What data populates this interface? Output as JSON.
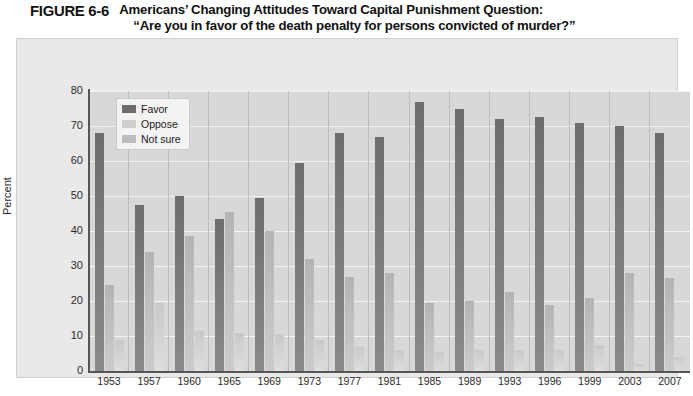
{
  "figure": {
    "label": "FIGURE 6-6",
    "title_line1": "Americans’ Changing Attitudes Toward Capital Punishment Question:",
    "title_line2": "“Are you in favor of the death penalty for persons convicted of murder?”"
  },
  "legend": {
    "position": "inside-top-left",
    "items": [
      {
        "label": "Favor",
        "color": "#6d6d6d"
      },
      {
        "label": "Oppose",
        "color": "#cfcfcf"
      },
      {
        "label": "Not sure",
        "color": "#bdbdbd"
      }
    ]
  },
  "axes": {
    "y_label": "Percent",
    "x_label": "Year",
    "y_ticks": [
      "80",
      "70",
      "60",
      "50",
      "40",
      "30",
      "20",
      "10",
      "0"
    ]
  },
  "chart_data": {
    "type": "bar",
    "title": "Americans’ Changing Attitudes Toward Capital Punishment Question: “Are you in favor of the death penalty for persons convicted of murder?”",
    "xlabel": "Year",
    "ylabel": "Percent",
    "ylim": [
      0,
      80
    ],
    "ytick_step": 10,
    "grid": true,
    "legend_position": "inside-top-left",
    "categories": [
      "1953",
      "1957",
      "1960",
      "1965",
      "1969",
      "1973",
      "1977",
      "1981",
      "1985",
      "1989",
      "1993",
      "1996",
      "1999",
      "2003",
      "2007"
    ],
    "series": [
      {
        "name": "Favor",
        "color": "#6d6d6d",
        "values": [
          68,
          47.5,
          50,
          43.5,
          49.5,
          59.5,
          68,
          67,
          77,
          75,
          72,
          72.5,
          71,
          70,
          68
        ]
      },
      {
        "name": "Oppose",
        "color": "#cfcfcf",
        "values": [
          24.5,
          34,
          38.5,
          45.5,
          40,
          32,
          27,
          28,
          19.5,
          20,
          22.5,
          19,
          21,
          28,
          26.5
        ]
      },
      {
        "name": "Not sure",
        "color": "#bdbdbd",
        "values": [
          9,
          19.5,
          11.5,
          11,
          10.5,
          9,
          7,
          6,
          5.5,
          6,
          6,
          6,
          7.5,
          2,
          4
        ]
      }
    ]
  }
}
